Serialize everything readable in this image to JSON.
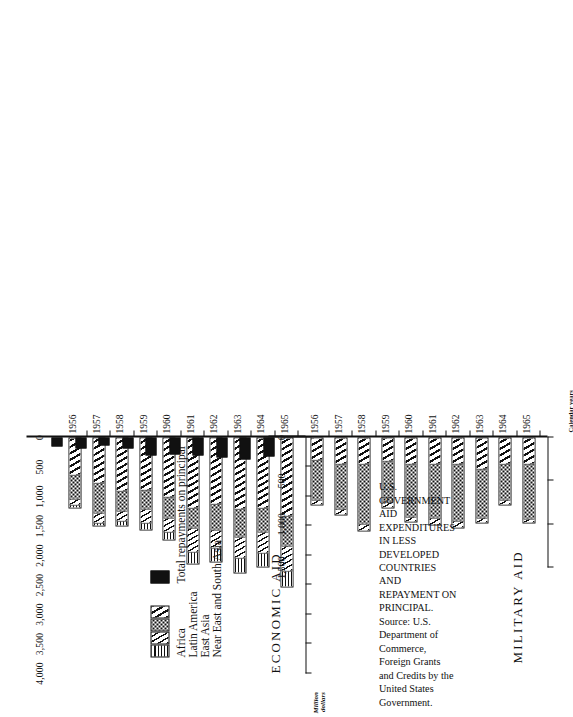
{
  "caption": {
    "line": "U.S. GOVERNMENT AID EXPENDITURES IN LESS DEVELOPED COUNTRIES AND REPAYMENT ON PRINCIPAL.  Source: U.S. Department of Commerce, Foreign Grants and Credits by the United States Government."
  },
  "axis_note": "Calendar years",
  "yaxis_title_line1": "Million",
  "yaxis_title_line2": "dollars",
  "legend": {
    "items": [
      {
        "label": "Africa",
        "pattern": "horizontal-lines"
      },
      {
        "label": "Latin America",
        "pattern": "diagonal-thin-hatch"
      },
      {
        "label": "East Asia",
        "pattern": "stipple-dots"
      },
      {
        "label": "Near East and South Asia",
        "pattern": "diagonal-wide-hatch"
      }
    ],
    "repayment": {
      "label": "Total repayments on principal",
      "pattern": "solid-black"
    }
  },
  "panels": [
    {
      "id": "economic",
      "title": "ECONOMIC AID"
    },
    {
      "id": "military",
      "title": "MILITARY AID"
    }
  ],
  "chart_data": {
    "type": "bar",
    "title": "U.S. GOVERNMENT AID EXPENDITURES IN LESS DEVELOPED COUNTRIES AND REPAYMENT ON PRINCIPAL",
    "orientation": "horizontal-stacked",
    "xlabel": "Calendar years",
    "ylabel": "Million dollars",
    "categories": [
      "1956",
      "1957",
      "1958",
      "1959",
      "1960",
      "1961",
      "1962",
      "1963",
      "1964",
      "1965"
    ],
    "panels": [
      {
        "name": "ECONOMIC AID",
        "ylim": [
          0,
          4000
        ],
        "yticks": [
          0,
          500,
          1000,
          1500,
          2000,
          2500,
          3000,
          3500,
          4000
        ],
        "ytick_labels": [
          "0",
          "500",
          "1,000",
          "1,500",
          "2,000",
          "2,500",
          "3,000",
          "3,500",
          "4,000"
        ],
        "stacked_series": [
          {
            "name": "Near East and South Asia",
            "values": [
              620,
              760,
              900,
              880,
              1000,
              1180,
              1120,
              1200,
              1180,
              1330
            ]
          },
          {
            "name": "East Asia",
            "values": [
              430,
              530,
              350,
              330,
              360,
              360,
              440,
              480,
              420,
              500
            ]
          },
          {
            "name": "Latin America",
            "values": [
              110,
              160,
              180,
              250,
              250,
              400,
              310,
              360,
              360,
              440
            ]
          },
          {
            "name": "Africa",
            "values": [
              40,
              60,
              80,
              110,
              140,
              220,
              250,
              270,
              240,
              280
            ]
          }
        ],
        "totals": [
          1200,
          1510,
          1510,
          1570,
          1750,
          2160,
          2120,
          2310,
          2200,
          2550
        ],
        "repayments": {
          "name": "Total repayments on principal",
          "values": [
            160,
            190,
            130,
            190,
            310,
            280,
            300,
            340,
            380,
            330
          ]
        }
      },
      {
        "name": "MILITARY AID",
        "ylim": [
          0,
          1500
        ],
        "yticks": [
          0,
          500,
          1000,
          1500
        ],
        "ytick_labels": [
          "0",
          "500",
          "1,000",
          "1,500"
        ],
        "stacked_series": [
          {
            "name": "Near East and South Asia",
            "values": [
              250,
              300,
              300,
              260,
              290,
              290,
              300,
              350,
              300,
              300
            ]
          },
          {
            "name": "East Asia",
            "values": [
              480,
              530,
              700,
              490,
              630,
              640,
              670,
              580,
              420,
              640
            ]
          },
          {
            "name": "Latin America",
            "values": [
              60,
              70,
              80,
              70,
              60,
              90,
              80,
              60,
              70,
              50
            ]
          },
          {
            "name": "Africa",
            "values": [
              0,
              0,
              0,
              0,
              0,
              0,
              0,
              0,
              0,
              0
            ]
          }
        ],
        "totals": [
          790,
          900,
          1080,
          820,
          980,
          1020,
          1050,
          990,
          790,
          990
        ]
      }
    ]
  }
}
